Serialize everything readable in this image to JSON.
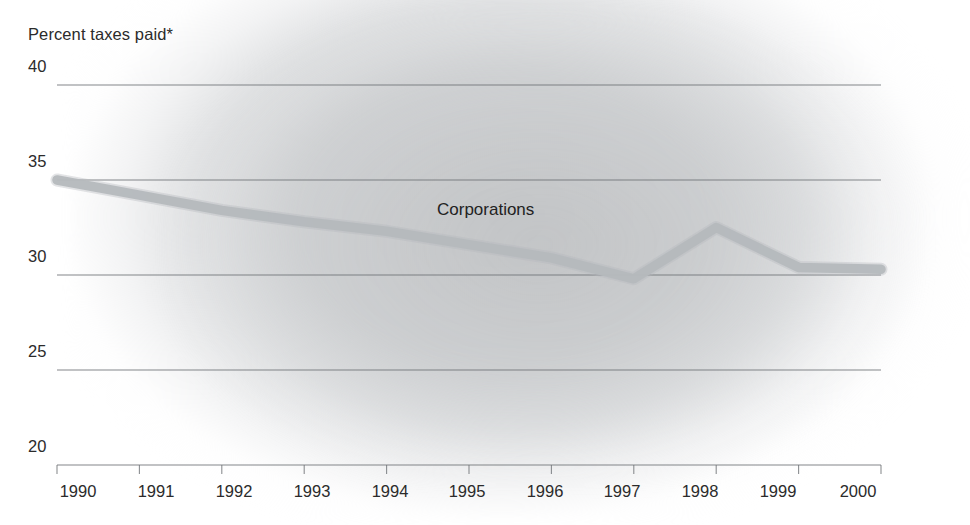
{
  "chart_data": {
    "type": "line",
    "title": "Percent taxes paid*",
    "xlabel": "",
    "ylabel": "Percent taxes paid*",
    "categories": [
      "1990",
      "1991",
      "1992",
      "1993",
      "1994",
      "1995",
      "1996",
      "1997",
      "1998",
      "1999",
      "2000"
    ],
    "x": [
      1990,
      1991,
      1992,
      1993,
      1994,
      1995,
      1996,
      1997,
      1998,
      1999,
      2000
    ],
    "series": [
      {
        "name": "Corporations",
        "values": [
          35.0,
          34.2,
          33.4,
          32.8,
          32.3,
          31.6,
          30.9,
          29.8,
          32.5,
          30.4,
          30.3
        ],
        "color": "#b5b9bd"
      }
    ],
    "ylim": [
      20,
      40
    ],
    "yticks": [
      20,
      25,
      30,
      35,
      40
    ],
    "ytick_labels": [
      "20",
      "25",
      "30",
      "35",
      "40"
    ],
    "xlim": [
      1990,
      2000
    ],
    "grid": true,
    "grid_color": "#6f7276",
    "legend": "inline-series-label",
    "annotations": [
      {
        "text": "Corporations",
        "x": 1995.4,
        "y": 33.2
      }
    ],
    "footnote_marker": "*",
    "background": "#ffffff"
  },
  "axes": {
    "y_tick_labels": [
      "40",
      "35",
      "30",
      "25",
      "20"
    ],
    "x_tick_labels": [
      "1990",
      "1991",
      "1992",
      "1993",
      "1994",
      "1995",
      "1996",
      "1997",
      "1998",
      "1999",
      "2000"
    ]
  },
  "labels": {
    "axis_title": "Percent taxes paid*",
    "series_annotation": "Corporations"
  },
  "colors": {
    "line": "#b5b9bd",
    "gridline": "#6f7276",
    "text": "#2b2b2b",
    "background": "#ffffff"
  }
}
